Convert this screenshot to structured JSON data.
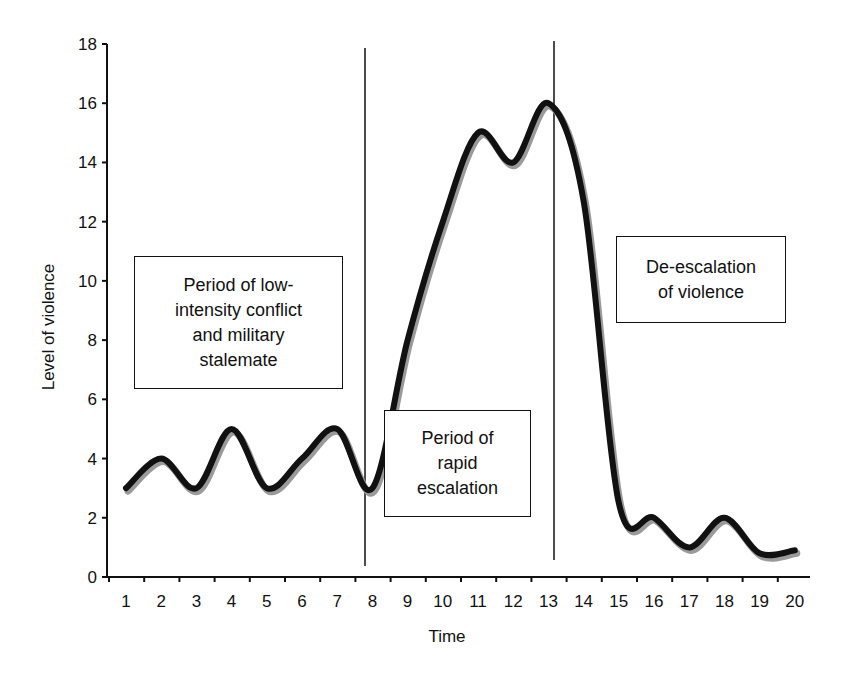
{
  "chart_data": {
    "type": "line",
    "title": "",
    "xlabel": "Time",
    "ylabel": "Level of violence",
    "x": [
      1,
      2,
      3,
      4,
      5,
      6,
      7,
      8,
      9,
      10,
      11,
      12,
      13,
      14,
      15,
      16,
      17,
      18,
      19,
      20
    ],
    "series": [
      {
        "name": "Level of violence",
        "values": [
          3,
          4,
          3,
          5,
          3,
          4,
          5,
          3,
          8,
          12,
          15,
          14,
          16,
          12.7,
          2.5,
          2,
          1,
          2,
          0.8,
          0.9
        ]
      }
    ],
    "ylim": [
      0,
      18
    ],
    "yticks": [
      0,
      2,
      4,
      6,
      8,
      10,
      12,
      14,
      16,
      18
    ],
    "xticks": [
      1,
      2,
      3,
      4,
      5,
      6,
      7,
      8,
      9,
      10,
      11,
      12,
      13,
      14,
      15,
      16,
      17,
      18,
      19,
      20
    ],
    "grid": false,
    "legend": "none",
    "vertical_lines": [
      7.7,
      13.1
    ],
    "annotations": [
      {
        "id": "low-intensity",
        "lines": [
          "Period of low-",
          "intensity conflict",
          "and military",
          "stalemate"
        ]
      },
      {
        "id": "rapid-escalation",
        "lines": [
          "Period of",
          "rapid",
          "escalation"
        ]
      },
      {
        "id": "de-escalation",
        "lines": [
          "De-escalation",
          "of violence"
        ]
      }
    ]
  },
  "labels": {
    "xlabel": "Time",
    "ylabel": "Level of violence",
    "box1": [
      "Period of low-",
      "intensity conflict",
      "and military",
      "stalemate"
    ],
    "box2": [
      "Period of",
      "rapid",
      "escalation"
    ],
    "box3": [
      "De-escalation",
      "of violence"
    ]
  },
  "colors": {
    "line": "#111111",
    "shadow": "#9a9a9a",
    "axis": "#111111"
  }
}
